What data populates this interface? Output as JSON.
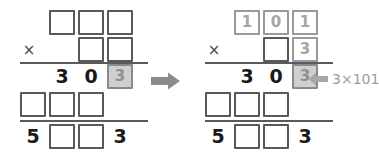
{
  "canvas": {
    "width": 369,
    "height": 157,
    "background": "#ffffff"
  },
  "colors": {
    "box_border": "#595959",
    "box_border_faint": "#9a9a9a",
    "highlight_fill": "#cfcfcf",
    "highlight_border": "#8a8a8a",
    "highlight_digit": "#8f8f8f",
    "digit": "#1a1a1a",
    "rule": "#555b66",
    "arrow": "#8c8c8c",
    "annotation_text": "#9b9b9b"
  },
  "panels": [
    {
      "id": "before",
      "name": "puzzle-before",
      "multiplicand": [
        {
          "type": "box",
          "value": "",
          "style": "empty"
        },
        {
          "type": "box",
          "value": "",
          "style": "empty"
        },
        {
          "type": "box",
          "value": "",
          "style": "empty"
        }
      ],
      "operator": "×",
      "multiplier": [
        {
          "type": "box",
          "value": "",
          "style": "empty"
        },
        {
          "type": "box",
          "value": "",
          "style": "empty"
        }
      ],
      "partial_product_1": [
        {
          "type": "digit",
          "value": "3",
          "style": "plain"
        },
        {
          "type": "digit",
          "value": "0",
          "style": "plain"
        },
        {
          "type": "box",
          "value": "3",
          "style": "highlight"
        }
      ],
      "partial_product_2": [
        {
          "type": "box",
          "value": "",
          "style": "empty"
        },
        {
          "type": "box",
          "value": "",
          "style": "empty"
        },
        {
          "type": "box",
          "value": "",
          "style": "empty"
        }
      ],
      "total": [
        {
          "type": "digit",
          "value": "5",
          "style": "plain"
        },
        {
          "type": "box",
          "value": "",
          "style": "empty"
        },
        {
          "type": "box",
          "value": "",
          "style": "empty"
        },
        {
          "type": "digit",
          "value": "3",
          "style": "plain"
        }
      ]
    },
    {
      "id": "after",
      "name": "puzzle-after",
      "multiplicand": [
        {
          "type": "box",
          "value": "1",
          "style": "faint"
        },
        {
          "type": "box",
          "value": "0",
          "style": "faint"
        },
        {
          "type": "box",
          "value": "1",
          "style": "faint"
        }
      ],
      "operator": "×",
      "multiplier": [
        {
          "type": "box",
          "value": "",
          "style": "empty"
        },
        {
          "type": "box",
          "value": "3",
          "style": "faint"
        }
      ],
      "partial_product_1": [
        {
          "type": "digit",
          "value": "3",
          "style": "plain"
        },
        {
          "type": "digit",
          "value": "0",
          "style": "plain"
        },
        {
          "type": "box",
          "value": "3",
          "style": "highlight"
        }
      ],
      "partial_product_2": [
        {
          "type": "box",
          "value": "",
          "style": "empty"
        },
        {
          "type": "box",
          "value": "",
          "style": "empty"
        },
        {
          "type": "box",
          "value": "",
          "style": "empty"
        }
      ],
      "total": [
        {
          "type": "digit",
          "value": "5",
          "style": "plain"
        },
        {
          "type": "box",
          "value": "",
          "style": "empty"
        },
        {
          "type": "box",
          "value": "",
          "style": "empty"
        },
        {
          "type": "digit",
          "value": "3",
          "style": "plain"
        }
      ]
    }
  ],
  "transition": {
    "icon": "right-arrow-icon"
  },
  "annotation": {
    "icon": "left-arrow-icon",
    "text": "3×101"
  }
}
